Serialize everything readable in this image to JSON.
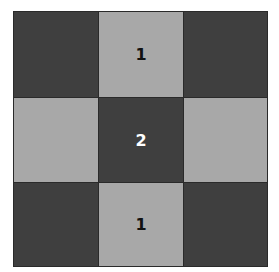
{
  "board": {
    "rows": 3,
    "cols": 3,
    "colors": {
      "dark": "#3f3f3f",
      "light": "#a8a8a8",
      "grid_line": "#2a2a2a",
      "dark_text": "#ffffff",
      "light_text": "#111111"
    },
    "cells": [
      [
        {
          "shade": "dark",
          "value": ""
        },
        {
          "shade": "light",
          "value": "1"
        },
        {
          "shade": "dark",
          "value": ""
        }
      ],
      [
        {
          "shade": "light",
          "value": ""
        },
        {
          "shade": "dark",
          "value": "2"
        },
        {
          "shade": "light",
          "value": ""
        }
      ],
      [
        {
          "shade": "dark",
          "value": ""
        },
        {
          "shade": "light",
          "value": "1"
        },
        {
          "shade": "dark",
          "value": ""
        }
      ]
    ]
  }
}
